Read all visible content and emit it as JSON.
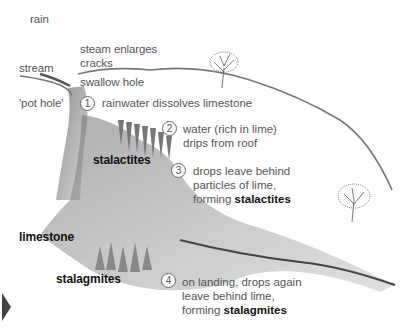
{
  "labels": {
    "rain": "rain",
    "stream": "stream",
    "stream_enlarges": "steam enlarges",
    "cracks": "cracks",
    "swallow_hole": "swallow hole",
    "pot_hole": "'pot hole'",
    "stalactites": "stalactites",
    "limestone": "limestone",
    "stalagmites": "stalagmites"
  },
  "steps": [
    {
      "num": "1",
      "lines": [
        "rainwater dissolves limestone"
      ]
    },
    {
      "num": "2",
      "lines": [
        "water (rich in lime)",
        "drips from roof"
      ]
    },
    {
      "num": "3",
      "lines": [
        "drops leave behind",
        "particles of lime,"
      ],
      "last_prefix": "forming ",
      "last_bold": "stalactites"
    },
    {
      "num": "4",
      "lines": [
        "on landing, drops again",
        "leave behind lime,"
      ],
      "last_prefix": "forming ",
      "last_bold": "stalagmites"
    }
  ],
  "nav": {
    "next_arrow": "next-arrow"
  }
}
